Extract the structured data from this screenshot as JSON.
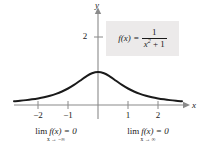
{
  "chart_data": {
    "type": "line",
    "title": "",
    "function_label": "f(x) = 1/(x^2 + 1)",
    "xlabel": "x",
    "ylabel": "y",
    "xlim": [
      -2.8,
      2.8
    ],
    "ylim": [
      -0.35,
      2.75
    ],
    "grid": false,
    "legend_position": "none",
    "x_ticks": [
      "-2",
      "-1",
      "1",
      "2"
    ],
    "x_tick_values": [
      -2,
      -1,
      1,
      2
    ],
    "y_ticks": [
      "2"
    ],
    "y_tick_values": [
      2
    ],
    "series": [
      {
        "name": "f(x) = 1/(x^2+1)",
        "color": "#1a1a1a",
        "x": [
          -2.8,
          -2.6,
          -2.4,
          -2.2,
          -2.0,
          -1.8,
          -1.6,
          -1.4,
          -1.2,
          -1.0,
          -0.8,
          -0.6,
          -0.4,
          -0.2,
          0.0,
          0.2,
          0.4,
          0.6,
          0.8,
          1.0,
          1.2,
          1.4,
          1.6,
          1.8,
          2.0,
          2.2,
          2.4,
          2.6,
          2.8
        ],
        "values": [
          0.113,
          0.129,
          0.148,
          0.171,
          0.2,
          0.236,
          0.281,
          0.338,
          0.41,
          0.5,
          0.61,
          0.735,
          0.862,
          0.962,
          1.0,
          0.962,
          0.862,
          0.735,
          0.61,
          0.5,
          0.41,
          0.338,
          0.281,
          0.236,
          0.2,
          0.171,
          0.148,
          0.129,
          0.113
        ]
      }
    ]
  },
  "formula": {
    "lhs": "f(x)",
    "equals": "=",
    "numerator": "1",
    "denominator_var": "x",
    "denominator_exp": "2",
    "denominator_rest": "+ 1"
  },
  "axes": {
    "x_axis_label": "x",
    "y_axis_label": "y",
    "x_tick_labels": [
      "−2",
      "−1",
      "1",
      "2"
    ],
    "y_tick_labels": [
      "2"
    ]
  },
  "annotations": {
    "left_limit": {
      "main_lim": "lim",
      "main_expr": "f(x) = 0",
      "sub": "x → −∞"
    },
    "right_limit": {
      "main_lim": "lim",
      "main_expr": "f(x) = 0",
      "sub": "x → ∞"
    }
  },
  "colors": {
    "curve": "#1a1a1a",
    "axis": "#8a8a8a",
    "callout_bg": "#eceaea",
    "text": "#1a1a1a",
    "background": "#ffffff"
  }
}
